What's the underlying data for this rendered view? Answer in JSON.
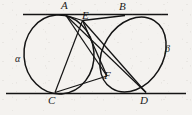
{
  "figure": {
    "kind": "geometry-diagram",
    "background_color": "#f4f2ef",
    "stroke_color": "#141414",
    "canvas": {
      "width": 192,
      "height": 115
    },
    "labels": {
      "A": "A",
      "B": "B",
      "C": "C",
      "D": "D",
      "E": "E",
      "F": "F",
      "alpha": "α",
      "beta": "β"
    },
    "label_positions": {
      "A": {
        "x": 61,
        "y": 1
      },
      "B": {
        "x": 119,
        "y": 2
      },
      "C": {
        "x": 48,
        "y": 95
      },
      "D": {
        "x": 140,
        "y": 95
      },
      "E": {
        "x": 82,
        "y": 11
      },
      "F": {
        "x": 104,
        "y": 71
      },
      "alpha": {
        "x": 15,
        "y": 54
      },
      "beta": {
        "x": 165,
        "y": 44
      }
    },
    "lines": {
      "top_line": {
        "x1": 23,
        "y1": 14.5,
        "x2": 168,
        "y2": 14.5
      },
      "bottom_line": {
        "x1": 6,
        "y1": 93.5,
        "x2": 186,
        "y2": 93.5
      }
    },
    "circle_alpha": {
      "label": "α",
      "cx": 59,
      "cy": 54.5,
      "rx": 35,
      "ry": 39.5,
      "rotation": -4
    },
    "circle_beta": {
      "label": "β",
      "cx": 133,
      "cy": 54.5,
      "rx": 30,
      "ry": 40,
      "rotation": 32
    },
    "points": {
      "A": {
        "x": 66,
        "y": 15
      },
      "B": {
        "x": 125,
        "y": 15
      },
      "C": {
        "x": 55,
        "y": 93
      },
      "D": {
        "x": 146,
        "y": 93
      },
      "E": {
        "x": 82,
        "y": 20
      },
      "F": {
        "x": 107,
        "y": 76
      }
    },
    "segments": [
      {
        "name": "A-E",
        "from": "A",
        "to": "E"
      },
      {
        "name": "A-F",
        "from": "A",
        "to": "F"
      },
      {
        "name": "B-E",
        "from": "B",
        "to": "E"
      },
      {
        "name": "E-D",
        "from": "E",
        "to": "D"
      },
      {
        "name": "E-F",
        "from": "E",
        "to": "F"
      },
      {
        "name": "C-F",
        "from": "C",
        "to": "F"
      },
      {
        "name": "C-E",
        "from": "C",
        "to": "E"
      }
    ]
  }
}
